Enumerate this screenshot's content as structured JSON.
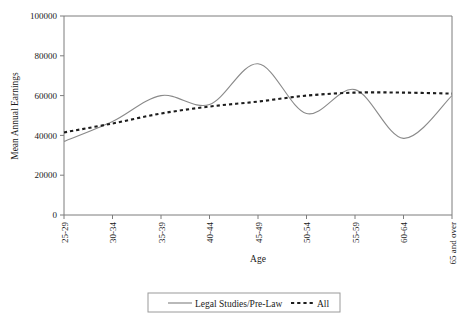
{
  "chart_data": {
    "type": "line",
    "title": "",
    "xlabel": "Age",
    "ylabel": "Mean Annual Earnings",
    "categories": [
      "25-29",
      "30-34",
      "35-39",
      "40-44",
      "45-49",
      "50-54",
      "55-59",
      "60-64",
      "65 and over"
    ],
    "ylim": [
      0,
      100000
    ],
    "yticks": [
      0,
      20000,
      40000,
      60000,
      80000,
      100000
    ],
    "ytick_labels": [
      "0",
      "20000",
      "40000",
      "60000",
      "80000",
      "100000"
    ],
    "grid": false,
    "legend_position": "bottom",
    "series": [
      {
        "name": "Legal Studies/Pre-Law",
        "style": "solid",
        "color": "#8a8a8a",
        "values": [
          37000,
          47000,
          60000,
          55500,
          76000,
          51000,
          63000,
          38500,
          60000
        ]
      },
      {
        "name": "All",
        "style": "dashed",
        "color": "#1c1c1c",
        "values": [
          41500,
          46000,
          51000,
          54500,
          57000,
          60000,
          61500,
          61500,
          61000
        ]
      }
    ]
  },
  "legend": {
    "items": [
      {
        "label": "Legal Studies/Pre-Law",
        "style": "solid"
      },
      {
        "label": "All",
        "style": "dashed"
      }
    ]
  }
}
